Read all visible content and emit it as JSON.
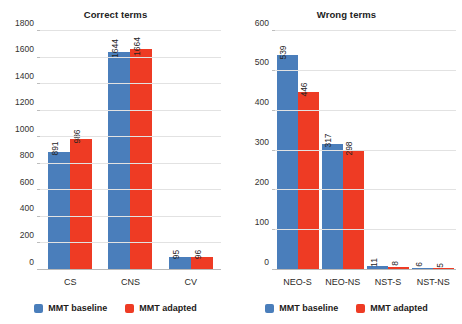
{
  "chart_data": [
    {
      "type": "bar",
      "title": "Correct terms",
      "xlabel": "",
      "ylabel": "",
      "categories": [
        "CS",
        "CNS",
        "CV"
      ],
      "series": [
        {
          "name": "MMT baseline",
          "color": "#4a7ebb",
          "values": [
            891,
            1644,
            95
          ]
        },
        {
          "name": "MMT adapted",
          "color": "#ee3b24",
          "values": [
            986,
            1664,
            96
          ]
        }
      ],
      "ylim": [
        0,
        1800
      ],
      "ytick_step": 200,
      "yticks": [
        0,
        200,
        400,
        600,
        800,
        1000,
        1200,
        1400,
        1600,
        1800
      ],
      "ytick_labels": [
        "0",
        "200",
        "400",
        "600",
        "800",
        "1000",
        "1200",
        "1400",
        "1600",
        "1800"
      ],
      "grid": true,
      "legend_position": "bottom",
      "data_labels": true,
      "data_label_rotation": -90
    },
    {
      "type": "bar",
      "title": "Wrong terms",
      "xlabel": "",
      "ylabel": "",
      "categories": [
        "NEO-S",
        "NEO-NS",
        "NST-S",
        "NST-NS"
      ],
      "series": [
        {
          "name": "MMT baseline",
          "color": "#4a7ebb",
          "values": [
            539,
            317,
            11,
            6
          ]
        },
        {
          "name": "MMT adapted",
          "color": "#ee3b24",
          "values": [
            446,
            298,
            8,
            5
          ]
        }
      ],
      "ylim": [
        0,
        600
      ],
      "ytick_step": 100,
      "yticks": [
        0,
        100,
        200,
        300,
        400,
        500,
        600
      ],
      "ytick_labels": [
        "0",
        "100",
        "200",
        "300",
        "400",
        "500",
        "600"
      ],
      "grid": true,
      "legend_position": "bottom",
      "data_labels": true,
      "data_label_rotation": -90
    }
  ],
  "colors": {
    "baseline": "#4a7ebb",
    "adapted": "#ee3b24",
    "gridline": "#e2e2e2",
    "axis": "#b9b9b9",
    "text": "#1a1a1a",
    "background": "#ffffff"
  }
}
